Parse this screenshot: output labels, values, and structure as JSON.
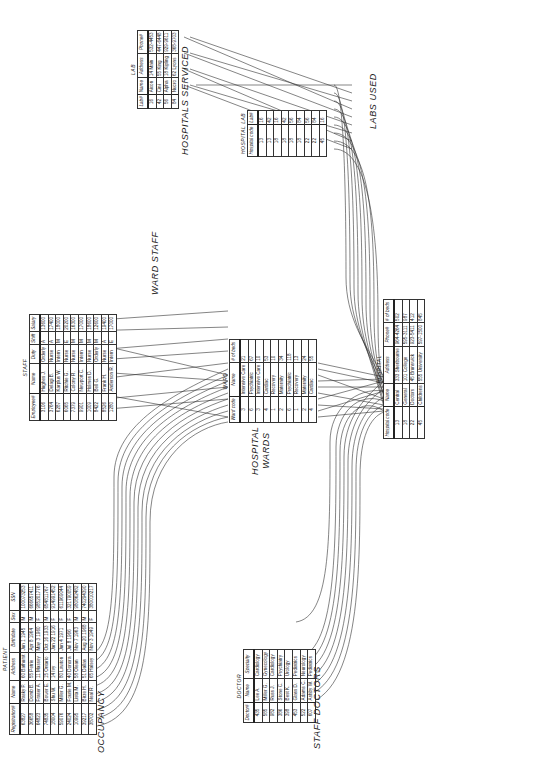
{
  "labels": {
    "occupancy": "OCCUPANCY",
    "ward_staff": "WARD STAFF",
    "staff_doctors": "STAFF DOCTORS",
    "hospital_wards": "HOSPITAL WARDS",
    "hospital_wards_l1": "HOSPITAL",
    "hospital_wards_l2": "WARDS",
    "labs_used": "LABS USED",
    "hospitals_serviced": "HOSPITALS SERVICED"
  },
  "patient": {
    "title": "PATIENT",
    "columns": [
      "Registration#",
      "Name",
      "Address",
      "Birthdate",
      "Sex",
      "SSN"
    ],
    "rows": [
      [
        "63827",
        "Rasky P.",
        "60 Bathurst",
        "Jun 1 1945",
        "M",
        "100073253"
      ],
      [
        "36658",
        "Domb B.",
        "55 Petrie",
        "Apr 8 1964",
        "M",
        "666657411"
      ],
      [
        "64823",
        "Fraser A.",
        "11 Massey",
        "May 3 1960",
        "F",
        "985201776"
      ],
      [
        "74835",
        "Bower E.",
        "15 Ontario",
        "Oct 16 1933",
        "M",
        "654811767"
      ],
      [
        "18004",
        "Shu W.",
        "14 Ivy",
        "Jan 22 1916",
        "F",
        "914991452"
      ],
      [
        "59076",
        "Miller G.",
        "80 Lawton",
        "Jun 4 1971",
        "F",
        "611969044"
      ],
      [
        "24024",
        "Fourie M.",
        "40 Donora",
        "Jul 8 1966",
        "F",
        "321790059"
      ],
      [
        "10995",
        "Lista M.",
        "58 Olean",
        "Nov 7 1963",
        "M",
        "980862482"
      ],
      [
        "39217",
        "Birze H.",
        "51 Dallas",
        "Aug 20 1968",
        "M",
        "740294390"
      ],
      [
        "38702",
        "Neal R.",
        "65 Halsey",
        "Nov 3 1949",
        "F",
        "380010217"
      ]
    ]
  },
  "staff": {
    "title": "STAFF",
    "columns": [
      "Employee#",
      "Name",
      "Duty",
      "Shift",
      "Salary"
    ],
    "rows": [
      [
        "3106",
        "Hughes J.",
        "Orderly",
        "A",
        "13600"
      ],
      [
        "3764",
        "Delagi B.",
        "Nurse",
        "A",
        "17400"
      ],
      [
        "6287",
        "Karplus W.",
        "Intern",
        "M",
        "18000"
      ],
      [
        "6065",
        "Ritchie G.",
        "Nurse",
        "E",
        "20200"
      ],
      [
        "7379",
        "Colony R.",
        "Nurse",
        "M",
        "16300"
      ],
      [
        "9901",
        "Newport C.",
        "Intern",
        "M",
        "17000"
      ],
      [
        "1009",
        "Holmes D.",
        "Nurse",
        "M",
        "18600"
      ],
      [
        "8422",
        "Bell G.",
        "Orderly",
        "M",
        "12600"
      ],
      [
        "8526",
        "Frank H.",
        "Nurse",
        "A",
        "19400"
      ],
      [
        "1280",
        "Anderson R.",
        "Intern",
        "E",
        "17000"
      ]
    ]
  },
  "lab": {
    "title": "LAB",
    "columns": [
      "Lab#",
      "Name",
      "Address",
      "Phone#"
    ],
    "rows": [
      [
        "16",
        "Aixon",
        "14 Main",
        "532-4453"
      ],
      [
        "42",
        "Cini",
        "55 King",
        "447-6448"
      ],
      [
        "56",
        "Alpha",
        "18 Kipling",
        "929-9611"
      ],
      [
        "84",
        "Nucro",
        "62 Lyons",
        "368-9703"
      ]
    ]
  },
  "doctor": {
    "title": "DOCTOR",
    "columns": [
      "Doctor#",
      "Name",
      "Specialty"
    ],
    "rows": [
      [
        "435",
        "Lee A.",
        "Cardiology"
      ],
      [
        "585",
        "Miller G.",
        "Gynecology"
      ],
      [
        "982",
        "Russ J.",
        "Cardiology"
      ],
      [
        "386",
        "Stone C.",
        "Psychiatry"
      ],
      [
        "398",
        "Best K.",
        "Urology"
      ],
      [
        "453",
        "Glass D.",
        "Pediatrics"
      ],
      [
        "522",
        "Adams C.",
        "Neurology"
      ],
      [
        "607",
        "Ashby W.",
        "Pediatrics"
      ]
    ]
  },
  "ward": {
    "title": "WARD",
    "columns": [
      "Ward code",
      "Name",
      "# of beds"
    ],
    "rows": [
      [
        "3",
        "Intensive Care",
        "21"
      ],
      [
        "6",
        "Psychiatric",
        "67"
      ],
      [
        "3",
        "Intensive Care",
        "10"
      ],
      [
        "4",
        "Cardiac",
        "53"
      ],
      [
        "1",
        "Recovery",
        "10"
      ],
      [
        "2",
        "Maternity",
        "34"
      ],
      [
        "6",
        "Psychiatric",
        "118"
      ],
      [
        "1",
        "Recovery",
        "13"
      ],
      [
        "2",
        "Maternity",
        "24"
      ],
      [
        "4",
        "Cardiac",
        "55"
      ]
    ]
  },
  "hospital_lab": {
    "title": "HOSPITAL LAB",
    "columns": [
      "Hospital code",
      "Lab#"
    ],
    "rows": [
      [
        "13",
        "16"
      ],
      [
        "13",
        "42"
      ],
      [
        "18",
        "16"
      ],
      [
        "18",
        "42"
      ],
      [
        "18",
        "56"
      ],
      [
        "18",
        "84"
      ],
      [
        "22",
        "56"
      ],
      [
        "22",
        "84"
      ],
      [
        "45",
        "16"
      ]
    ]
  },
  "hospital": {
    "title": "HOSPITAL",
    "columns": [
      "Hospital code",
      "Name",
      "Address",
      "Phone#",
      "# of beds"
    ],
    "rows": [
      [
        "13",
        "Central",
        "333 Sherbourne",
        "964-4264",
        "502"
      ],
      [
        "18",
        "General",
        "101 College",
        "595-3111",
        "987"
      ],
      [
        "22",
        "Doctors",
        "45 Brunswick",
        "923-5411",
        "412"
      ],
      [
        "45",
        "Childrens",
        "555 University",
        "597-1500",
        "845"
      ]
    ]
  }
}
